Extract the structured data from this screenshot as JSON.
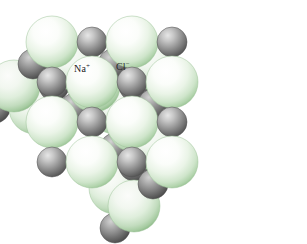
{
  "figure": {
    "name": "sodium-chloride-crystal-lattice",
    "background_color": "#ffffff",
    "width": 307,
    "height": 244
  },
  "labels": {
    "sodium": {
      "text": "Na",
      "charge": "+",
      "full": "Na+"
    },
    "chloride": {
      "text": "Cl",
      "charge": "−",
      "full": "Cl−"
    }
  },
  "colors": {
    "chloride_sphere_light": "#ffffff",
    "chloride_sphere_mid": "#e9f3e7",
    "chloride_sphere_edge": "#b8d6b4",
    "chloride_sphere_shadow": "#9ec19a",
    "sodium_sphere_light": "#f0f0f0",
    "sodium_sphere_mid": "#9a9a9a",
    "sodium_sphere_edge": "#666666",
    "sodium_sphere_shadow": "#4a4a4a",
    "label_text": "#1c1c1c"
  },
  "chart_data": {
    "type": "scatter",
    "xlabel": "",
    "ylabel": "",
    "legend": [
      "Na+",
      "Cl−"
    ],
    "lattice": {
      "type": "rock-salt (face-centered cubic)",
      "grid": [
        4,
        4,
        4
      ],
      "large_sphere_radius_px": 26,
      "small_sphere_radius_px": 15,
      "axis_a_px": [
        40,
        0
      ],
      "axis_b_px": [
        -19,
        22
      ],
      "axis_c_px": [
        0,
        40
      ],
      "origin_px": [
        52,
        42
      ]
    },
    "ions": [
      {
        "species": "Cl-",
        "i": 0,
        "j": 0,
        "k": 0
      },
      {
        "species": "Na+",
        "i": 1,
        "j": 0,
        "k": 0
      },
      {
        "species": "Cl-",
        "i": 2,
        "j": 0,
        "k": 0
      },
      {
        "species": "Na+",
        "i": 3,
        "j": 0,
        "k": 0
      },
      {
        "species": "Na+",
        "i": 0,
        "j": 1,
        "k": 0
      },
      {
        "species": "Cl-",
        "i": 1,
        "j": 1,
        "k": 0
      },
      {
        "species": "Na+",
        "i": 2,
        "j": 1,
        "k": 0
      },
      {
        "species": "Cl-",
        "i": 3,
        "j": 1,
        "k": 0
      },
      {
        "species": "Cl-",
        "i": 0,
        "j": 2,
        "k": 0
      },
      {
        "species": "Na+",
        "i": 1,
        "j": 2,
        "k": 0
      },
      {
        "species": "Cl-",
        "i": 2,
        "j": 2,
        "k": 0
      },
      {
        "species": "Na+",
        "i": 3,
        "j": 2,
        "k": 0
      },
      {
        "species": "Na+",
        "i": 0,
        "j": 0,
        "k": 1
      },
      {
        "species": "Cl-",
        "i": 1,
        "j": 0,
        "k": 1
      },
      {
        "species": "Na+",
        "i": 2,
        "j": 0,
        "k": 1
      },
      {
        "species": "Cl-",
        "i": 3,
        "j": 0,
        "k": 1
      },
      {
        "species": "Cl-",
        "i": 0,
        "j": 0,
        "k": 2
      },
      {
        "species": "Na+",
        "i": 1,
        "j": 0,
        "k": 2
      },
      {
        "species": "Cl-",
        "i": 2,
        "j": 0,
        "k": 2
      },
      {
        "species": "Na+",
        "i": 3,
        "j": 0,
        "k": 2
      },
      {
        "species": "Na+",
        "i": 0,
        "j": 0,
        "k": 3
      },
      {
        "species": "Cl-",
        "i": 1,
        "j": 0,
        "k": 3
      },
      {
        "species": "Na+",
        "i": 2,
        "j": 0,
        "k": 3
      },
      {
        "species": "Cl-",
        "i": 3,
        "j": 0,
        "k": 3
      }
    ],
    "labeled_ions": [
      {
        "label": "Na+",
        "x": 86,
        "y": 70,
        "species": "Na+"
      },
      {
        "label": "Cl−",
        "x": 127,
        "y": 68,
        "species": "Cl-"
      }
    ]
  }
}
